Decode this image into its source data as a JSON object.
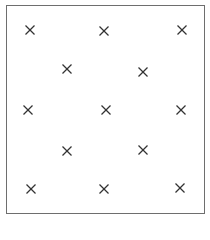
{
  "diagram": {
    "type": "grid-of-marks",
    "mark_icon": "x-mark-icon",
    "mark_color": "#333333",
    "frame_color": "#6e6e6e",
    "marks": [
      {
        "x": 30,
        "y": 30
      },
      {
        "x": 104,
        "y": 31
      },
      {
        "x": 182,
        "y": 30
      },
      {
        "x": 67,
        "y": 69
      },
      {
        "x": 143,
        "y": 72
      },
      {
        "x": 28,
        "y": 110
      },
      {
        "x": 106,
        "y": 110
      },
      {
        "x": 181,
        "y": 110
      },
      {
        "x": 67,
        "y": 151
      },
      {
        "x": 143,
        "y": 150
      },
      {
        "x": 31,
        "y": 189
      },
      {
        "x": 104,
        "y": 189
      },
      {
        "x": 180,
        "y": 188
      }
    ]
  }
}
